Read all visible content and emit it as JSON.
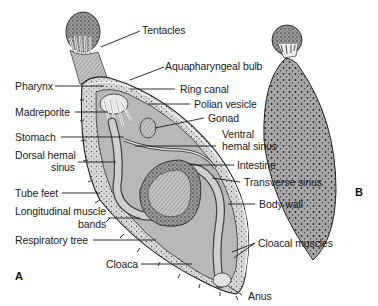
{
  "figure": {
    "panels": {
      "a": "A",
      "b": "B"
    },
    "labels": {
      "tentacles": "Tentacles",
      "aquapharyngeal_bulb": "Aquapharyngeal bulb",
      "pharynx": "Pharynx",
      "ring_canal": "Ring canal",
      "madreporite": "Madreporite",
      "polian_vesicle": "Polian vesicle",
      "gonad": "Gonad",
      "stomach": "Stomach",
      "ventral_hemal_sinus_1": "Ventral",
      "ventral_hemal_sinus_2": "hemal sinus",
      "dorsal_hemal_sinus_1": "Dorsal hemal",
      "dorsal_hemal_sinus_2": "sinus",
      "intestine": "Intestine",
      "transverse_sinus": "Transverse sinus",
      "tube_feet": "Tube feet",
      "body_wall": "Body wall",
      "longitudinal_muscle_1": "Longitudinal muscle",
      "longitudinal_muscle_2": "bands",
      "respiratory_tree": "Respiratory tree",
      "cloacal_muscles": "Cloacal muscles",
      "cloaca": "Cloaca",
      "anus": "Anus"
    }
  }
}
